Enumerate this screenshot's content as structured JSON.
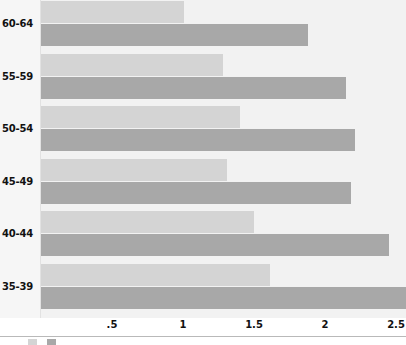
{
  "chart_data": {
    "type": "bar",
    "orientation": "horizontal",
    "title": "",
    "xlabel": "",
    "ylabel": "",
    "categories": [
      "60-64",
      "55-59",
      "50-54",
      "45-49",
      "40-44",
      "35-39"
    ],
    "xlim": [
      0,
      2.57
    ],
    "xticks": [
      0.5,
      1,
      1.5,
      2,
      2.5
    ],
    "xticklabels": [
      ".5",
      "1",
      "1.5",
      "2",
      "2.5"
    ],
    "grid": false,
    "legend_position": "bottom-left",
    "series": [
      {
        "name": "series-a",
        "color": "#d4d4d4",
        "values": [
          1.01,
          1.28,
          1.4,
          1.31,
          1.5,
          1.61
        ]
      },
      {
        "name": "series-b",
        "color": "#a8a8a8",
        "values": [
          1.88,
          2.15,
          2.21,
          2.18,
          2.45,
          2.57
        ]
      }
    ]
  },
  "axis": {
    "tick_labels": [
      ".5",
      "1",
      "1.5",
      "2",
      "2.5"
    ]
  },
  "categories": [
    "60-64",
    "55-59",
    "50-54",
    "45-49",
    "40-44",
    "35-39"
  ],
  "colors": {
    "series_a": "#d4d4d4",
    "series_b": "#a8a8a8",
    "panel_background": "#f2f2f2",
    "gutter_background": "#f6f6f6",
    "axis_line": "#b9b9b9",
    "text": "#111111"
  }
}
